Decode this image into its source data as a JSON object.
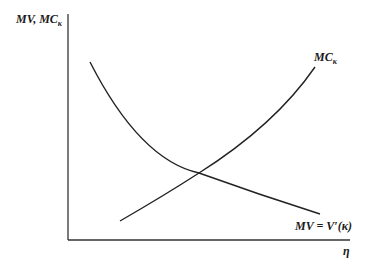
{
  "diagram": {
    "y_axis_label": "MV, MC",
    "y_axis_label_subscript": "κ",
    "x_axis_label": "η",
    "curves": [
      {
        "name": "MC",
        "subscript": "κ",
        "label": "MC",
        "shape": "upward-sloping convex"
      },
      {
        "name": "MV",
        "label": "MV = V′(κ)",
        "shape": "downward-sloping convex"
      }
    ],
    "colors": {
      "line": "#222222",
      "background": "#ffffff"
    }
  }
}
